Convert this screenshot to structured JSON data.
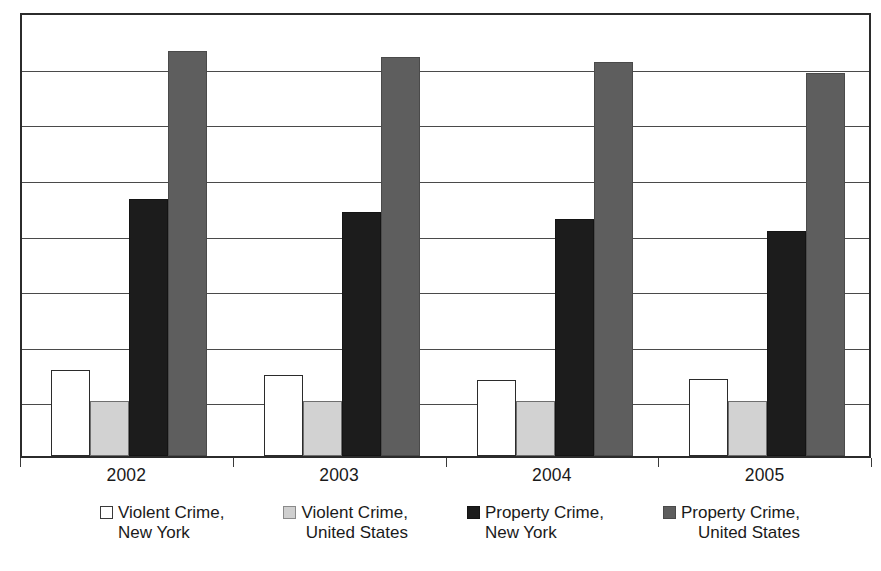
{
  "chart_data": {
    "type": "bar",
    "title": "",
    "subtitle": "",
    "xlabel": "",
    "ylabel": "",
    "categories": [
      "2002",
      "2003",
      "2004",
      "2005"
    ],
    "series": [
      {
        "name": "Violent Crime, New York",
        "legend_line1": "Violent Crime,",
        "legend_line2": "New York",
        "color": "#ffffff",
        "swatch": "white-outlined",
        "values": [
          19.3,
          18.2,
          17.1,
          17.3
        ]
      },
      {
        "name": "Violent Crime, United States",
        "legend_line1": "Violent Crime,",
        "legend_line2": "United States",
        "color": "#d2d2d2",
        "swatch": "light-gray",
        "values": [
          12.4,
          12.4,
          12.4,
          12.4
        ]
      },
      {
        "name": "Property Crime, New York",
        "legend_line1": "Property Crime,",
        "legend_line2": "New York",
        "color": "#1c1c1c",
        "swatch": "black",
        "values": [
          57.8,
          54.8,
          53.3,
          50.6
        ]
      },
      {
        "name": "Property Crime, United States",
        "legend_line1": "Property Crime,",
        "legend_line2": "United States",
        "color": "#5e5e5e",
        "swatch": "mid-gray",
        "values": [
          91.0,
          89.7,
          88.5,
          86.1
        ]
      }
    ],
    "ylim": [
      0,
      100
    ],
    "gridline_count": 8,
    "gridline_values": [
      12.5,
      25,
      37.5,
      50,
      62.5,
      75,
      87.5,
      100
    ],
    "grid": true,
    "y_axis_ticklabels": [],
    "legend_position": "bottom",
    "legend_columns": 4,
    "plot_border": true,
    "colors": {
      "axis": "#2b2b2b",
      "gridline": "#4a4a4a",
      "text": "#1a1a1a",
      "background": "#ffffff"
    }
  }
}
